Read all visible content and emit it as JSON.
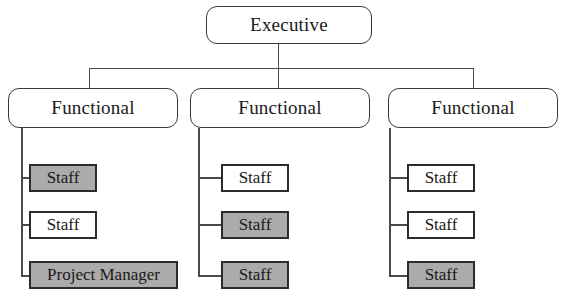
{
  "diagram": {
    "colors": {
      "shaded_fill": "#ababab",
      "plain_fill": "#ffffff",
      "line": "#4a4a4a",
      "box_border": "#2b2b2b",
      "text": "#1a1a1a"
    },
    "root": {
      "label": "Executive"
    },
    "branches": [
      {
        "label": "Functional",
        "children": [
          {
            "label": "Staff",
            "fill": "shaded"
          },
          {
            "label": "Staff",
            "fill": "plain"
          },
          {
            "label": "Project Manager",
            "fill": "shaded"
          }
        ]
      },
      {
        "label": "Functional",
        "children": [
          {
            "label": "Staff",
            "fill": "plain"
          },
          {
            "label": "Staff",
            "fill": "shaded"
          },
          {
            "label": "Staff",
            "fill": "shaded"
          }
        ]
      },
      {
        "label": "Functional",
        "children": [
          {
            "label": "Staff",
            "fill": "plain"
          },
          {
            "label": "Staff",
            "fill": "plain"
          },
          {
            "label": "Staff",
            "fill": "shaded"
          }
        ]
      }
    ]
  }
}
